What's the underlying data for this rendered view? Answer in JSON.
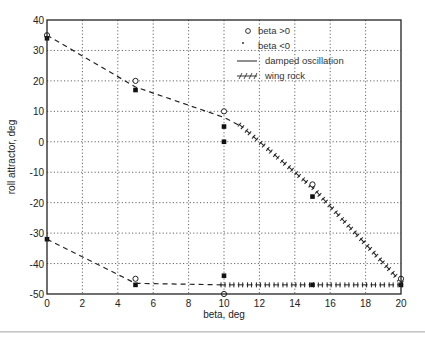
{
  "chart_data": {
    "type": "scatter",
    "title": "",
    "xlabel": "beta, deg",
    "ylabel": "roll attractor, deg",
    "xlim": [
      0,
      20
    ],
    "ylim": [
      -50,
      40
    ],
    "grid": true,
    "legend_position": "upper right (inside)",
    "xticks": [
      "0",
      "2",
      "4",
      "6",
      "8",
      "10",
      "12",
      "14",
      "16",
      "18",
      "20"
    ],
    "yticks": [
      "40",
      "30",
      "20",
      "10",
      "0",
      "-10",
      "-20",
      "-30",
      "-40",
      "-50"
    ],
    "legend": [
      {
        "marker": "o",
        "label": "beta >0"
      },
      {
        "marker": ".",
        "label": "beta <0"
      },
      {
        "marker": "solid-line",
        "label": "damped oscillation"
      },
      {
        "marker": "hatched-line",
        "label": "wing rock"
      }
    ],
    "series": [
      {
        "name": "beta >0",
        "marker": "o",
        "points": [
          [
            0,
            35
          ],
          [
            5,
            20
          ],
          [
            10,
            10
          ],
          [
            15,
            -14
          ],
          [
            20,
            -45
          ],
          [
            10,
            -50
          ],
          [
            5,
            -45
          ]
        ]
      },
      {
        "name": "beta <0",
        "marker": "square",
        "points": [
          [
            0,
            34
          ],
          [
            5,
            17
          ],
          [
            10,
            5
          ],
          [
            10,
            0
          ],
          [
            15,
            -18
          ],
          [
            20,
            -47
          ],
          [
            10,
            -44
          ],
          [
            15,
            -47
          ],
          [
            5,
            -47
          ],
          [
            0,
            -32
          ]
        ]
      },
      {
        "name": "damped oscillation (upper branch)",
        "style": "dashed",
        "points": [
          [
            0,
            35
          ],
          [
            5,
            18
          ],
          [
            10,
            8
          ],
          [
            11,
            5
          ]
        ]
      },
      {
        "name": "wing rock (upper branch)",
        "style": "hatched",
        "points": [
          [
            11,
            5
          ],
          [
            15,
            -15
          ],
          [
            20,
            -46
          ]
        ]
      },
      {
        "name": "damped oscillation (lower branch)",
        "style": "dashed",
        "points": [
          [
            0,
            -32
          ],
          [
            5,
            -46.5
          ],
          [
            10,
            -47
          ]
        ]
      },
      {
        "name": "wing rock (lower branch)",
        "style": "hatched",
        "points": [
          [
            10,
            -47
          ],
          [
            15,
            -47
          ],
          [
            20,
            -47
          ]
        ]
      }
    ]
  }
}
